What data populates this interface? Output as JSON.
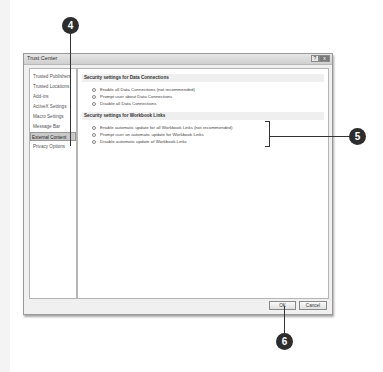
{
  "window": {
    "title": "Trust Center",
    "help_label": "?",
    "close_label": "x"
  },
  "sidebar": {
    "items": [
      {
        "label": "Trusted Publishers",
        "selected": false
      },
      {
        "label": "Trusted Locations",
        "selected": false
      },
      {
        "label": "Add-ins",
        "selected": false
      },
      {
        "label": "ActiveX Settings",
        "selected": false
      },
      {
        "label": "Macro Settings",
        "selected": false
      },
      {
        "label": "Message Bar",
        "selected": false
      },
      {
        "label": "External Content",
        "selected": true
      },
      {
        "label": "Privacy Options",
        "selected": false
      }
    ]
  },
  "content": {
    "data_connections": {
      "heading": "Security settings for Data Connections",
      "options": [
        {
          "label": "Enable all Data Connections (not recommended)",
          "checked": false
        },
        {
          "label": "Prompt user about Data Connections",
          "checked": true
        },
        {
          "label": "Disable all Data Connections",
          "checked": false
        }
      ]
    },
    "workbook_links": {
      "heading": "Security settings for Workbook Links",
      "options": [
        {
          "label": "Enable automatic update for all Workbook Links (not recommended)",
          "checked": false
        },
        {
          "label": "Prompt user on automatic update for Workbook Links",
          "checked": true
        },
        {
          "label": "Disable automatic update of Workbook Links",
          "checked": false
        }
      ]
    }
  },
  "buttons": {
    "ok": "OK",
    "cancel": "Cancel"
  },
  "callouts": {
    "c4": "4",
    "c5": "5",
    "c6": "6"
  }
}
